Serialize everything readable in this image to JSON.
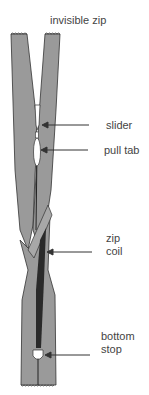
{
  "diagram": {
    "title": "invisible zip",
    "labels": [
      {
        "id": "slider",
        "text": "slider"
      },
      {
        "id": "pull_tab",
        "text": "pull tab"
      },
      {
        "id": "zip_coil_line1",
        "text": "zip"
      },
      {
        "id": "zip_coil_line2",
        "text": "coil"
      },
      {
        "id": "bottom_stop_line1",
        "text": "bottom"
      },
      {
        "id": "bottom_stop_line2",
        "text": "stop"
      }
    ],
    "colors": {
      "tape": "#9a9a9a",
      "outline": "#333333",
      "coil": "#2a2a2a",
      "text": "#444444",
      "arrow": "#333333"
    }
  }
}
